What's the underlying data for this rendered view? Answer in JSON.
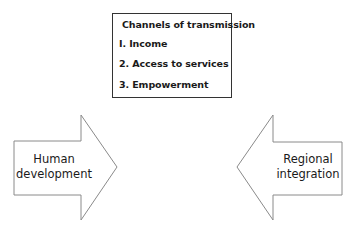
{
  "box": {
    "title": "Channels of transmission",
    "items": [
      "I. Income",
      "2. Access to services",
      "3. Empowerment"
    ]
  },
  "left_arrow": {
    "line1": "Human",
    "line2": "development",
    "direction": "right"
  },
  "right_arrow": {
    "line1": "Regional",
    "line2": "integration",
    "direction": "left"
  },
  "colors": {
    "stroke": "#8a8a8a",
    "box_border": "#333333",
    "text": "#1a1a1a"
  }
}
